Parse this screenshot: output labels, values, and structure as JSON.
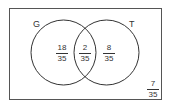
{
  "diagram": {
    "type": "venn",
    "sets": [
      {
        "label": "G"
      },
      {
        "label": "T"
      }
    ],
    "regions": {
      "g_only": {
        "num": "18",
        "den": "35"
      },
      "both": {
        "num": "2",
        "den": "35"
      },
      "t_only": {
        "num": "8",
        "den": "35"
      },
      "neither": {
        "num": "7",
        "den": "35"
      }
    }
  }
}
